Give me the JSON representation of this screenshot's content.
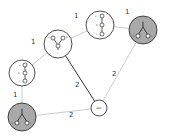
{
  "diagram": {
    "colors": {
      "edge_light": "#c8c8c8",
      "edge_dark": "#333333",
      "node_white": "#ffffff",
      "node_gray": "#a9a9a9",
      "node_stroke": "#222222"
    },
    "nodes": [
      {
        "id": "n1",
        "kind": "tree",
        "fill": "white",
        "cx": 58,
        "cy": 44,
        "r": 14
      },
      {
        "id": "n2",
        "kind": "chain",
        "fill": "white",
        "cx": 100,
        "cy": 25,
        "r": 14
      },
      {
        "id": "n3",
        "kind": "tree",
        "fill": "gray",
        "cx": 143,
        "cy": 30,
        "r": 14
      },
      {
        "id": "n4",
        "kind": "chain",
        "fill": "white",
        "cx": 22,
        "cy": 73,
        "r": 13
      },
      {
        "id": "n5",
        "kind": "tree",
        "fill": "gray",
        "cx": 22,
        "cy": 117,
        "r": 14
      },
      {
        "id": "n6",
        "kind": "label",
        "fill": "white",
        "cx": 99,
        "cy": 108,
        "r": 8,
        "label": "abc"
      }
    ],
    "edges": [
      {
        "from": "n4",
        "to": "n1",
        "weight": "1",
        "style": "light"
      },
      {
        "from": "n1",
        "to": "n2",
        "weight": "1",
        "style": "light"
      },
      {
        "from": "n2",
        "to": "n3",
        "weight": "1",
        "style": "light"
      },
      {
        "from": "n4",
        "to": "n5",
        "weight": "1",
        "style": "light"
      },
      {
        "from": "n1",
        "to": "n6",
        "weight": "2",
        "style": "dark"
      },
      {
        "from": "n3",
        "to": "n6",
        "weight": "2",
        "style": "light"
      },
      {
        "from": "n5",
        "to": "n6",
        "weight": "2",
        "style": "light"
      }
    ],
    "edge_labels": {
      "e_n4_n1": "1",
      "e_n1_n2": "1",
      "e_n2_n3": "1",
      "e_n4_n5": "1",
      "e_n1_n6": "2",
      "e_n3_n6": "2",
      "e_n5_n6": "2"
    },
    "center_node_label": "abc",
    "inner_node_labels": {
      "a": "a",
      "b": "b",
      "c": "c"
    }
  }
}
